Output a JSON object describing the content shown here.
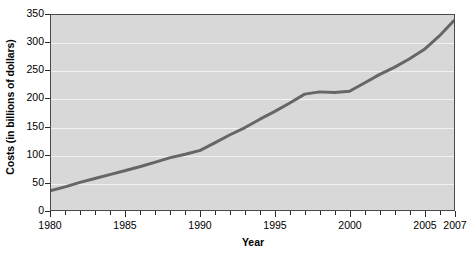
{
  "chart_data": {
    "type": "line",
    "title": "",
    "xlabel": "Year",
    "ylabel": "Costs (in billions of dollars)",
    "xlim": [
      1980,
      2007
    ],
    "ylim": [
      0,
      350
    ],
    "grid": true,
    "legend": null,
    "line_color": "#666666",
    "plot_background": "#d8d8d8",
    "gridline_color": "#f2f2f2",
    "axis_color": "#4a4a4a",
    "y_ticks": [
      0,
      50,
      100,
      150,
      200,
      250,
      300,
      350
    ],
    "y_tick_labels": [
      "0",
      "50",
      "100",
      "150",
      "200",
      "250",
      "300",
      "350"
    ],
    "x_ticks_all": [
      1980,
      1981,
      1982,
      1983,
      1984,
      1985,
      1986,
      1987,
      1988,
      1989,
      1990,
      1991,
      1992,
      1993,
      1994,
      1995,
      1996,
      1997,
      1998,
      1999,
      2000,
      2001,
      2002,
      2003,
      2004,
      2005,
      2006,
      2007
    ],
    "x_tick_labels": [
      {
        "value": 1980,
        "label": "1980"
      },
      {
        "value": 1985,
        "label": "1985"
      },
      {
        "value": 1990,
        "label": "1990"
      },
      {
        "value": 1995,
        "label": "1995"
      },
      {
        "value": 2000,
        "label": "2000"
      },
      {
        "value": 2005,
        "label": "2005"
      },
      {
        "value": 2007,
        "label": "2007"
      }
    ],
    "x": [
      1980,
      1981,
      1982,
      1983,
      1984,
      1985,
      1986,
      1987,
      1988,
      1989,
      1990,
      1991,
      1992,
      1993,
      1994,
      1995,
      1996,
      1997,
      1998,
      1999,
      2000,
      2001,
      2002,
      2003,
      2004,
      2005,
      2006,
      2007
    ],
    "values": [
      35,
      42,
      50,
      57,
      64,
      71,
      78,
      86,
      94,
      100,
      107,
      121,
      135,
      148,
      163,
      177,
      192,
      208,
      212,
      211,
      213,
      228,
      243,
      256,
      271,
      288,
      312,
      340
    ],
    "series": [
      {
        "name": "Costs",
        "values": [
          35,
          42,
          50,
          57,
          64,
          71,
          78,
          86,
          94,
          100,
          107,
          121,
          135,
          148,
          163,
          177,
          192,
          208,
          212,
          211,
          213,
          228,
          243,
          256,
          271,
          288,
          312,
          340
        ]
      }
    ]
  }
}
